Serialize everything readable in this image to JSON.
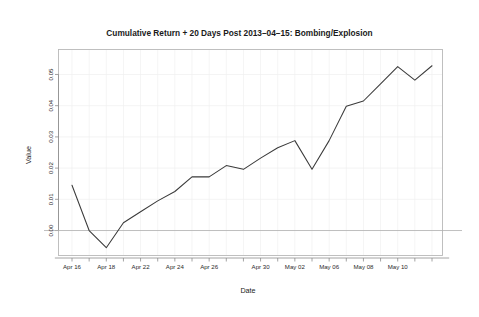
{
  "chart_data": {
    "type": "line",
    "title": "Cumulative Return + 20 Days Post 2013–04–15: Bombing/Explosion",
    "xlabel": "Date",
    "ylabel": "Value",
    "grid": true,
    "legend": "none",
    "ylim": [
      -0.008,
      0.058
    ],
    "ytick_values": [
      0.0,
      0.01,
      0.02,
      0.03,
      0.04,
      0.05
    ],
    "ytick_labels": [
      "0.00",
      "0.01",
      "0.02",
      "0.03",
      "0.04",
      "0.05"
    ],
    "zero_reference_line": 0.0,
    "xtick_labels": [
      "Apr 16",
      "Apr 18",
      "Apr 22",
      "Apr 24",
      "Apr 26",
      "Apr 30",
      "May 02",
      "May 06",
      "May 08",
      "May 10"
    ],
    "xtick_label_indices": [
      0,
      2,
      4,
      6,
      8,
      11,
      13,
      15,
      17,
      19
    ],
    "x": [
      "Apr 16",
      "Apr 17",
      "Apr 18",
      "Apr 19",
      "Apr 22",
      "Apr 23",
      "Apr 24",
      "Apr 25",
      "Apr 26",
      "Apr 29",
      "Apr 30",
      "May 01",
      "May 02",
      "May 03",
      "May 06",
      "May 07",
      "May 08",
      "May 09",
      "May 10",
      "May 13",
      "May 14",
      "May 15"
    ],
    "x_index": [
      0,
      1,
      2,
      3,
      4,
      5,
      6,
      7,
      8,
      9,
      10,
      11,
      12,
      13,
      14,
      15,
      16,
      17,
      18,
      19,
      20,
      21
    ],
    "series": [
      {
        "name": "Cumulative Return",
        "values": [
          0.0145,
          0.0,
          -0.0055,
          0.0025,
          0.006,
          0.0095,
          0.0125,
          0.0172,
          0.0172,
          0.0208,
          0.0196,
          0.0232,
          0.0265,
          0.0288,
          0.0196,
          0.0288,
          0.0398,
          0.0415,
          0.047,
          0.0525,
          0.0482,
          0.0528
        ]
      }
    ]
  },
  "figure": {
    "background_color": "#ffffff",
    "line_color": "#3a3a3a",
    "grid_color": "#efefef",
    "axis_color": "#8d8d8d"
  }
}
